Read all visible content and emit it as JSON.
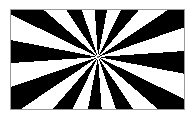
{
  "figure": {
    "title": "Starburst radial pattern",
    "kind": "radial-sunburst",
    "background_color": "#ffffff",
    "page_background_color": "#ffffff",
    "border_color": "#9a9a9a",
    "border_width_px": 1,
    "frame": {
      "left_px": 10,
      "top_px": 9,
      "width_px": 175,
      "height_px": 101
    }
  },
  "chart_data": {
    "type": "pie",
    "title": "Starburst radial pattern",
    "subtitle": "",
    "xlabel": "",
    "ylabel": "",
    "legend_position": "none",
    "grid": false,
    "center": {
      "x_px": 98,
      "y_px": 57,
      "x_fraction": 0.503,
      "y_fraction": 0.475
    },
    "sector_count": 24,
    "ray_count": 12,
    "start_angle_deg": -4,
    "colors": [
      "#000000",
      "#ffffff"
    ],
    "categories": [
      "sector-1",
      "sector-2",
      "sector-3",
      "sector-4",
      "sector-5",
      "sector-6",
      "sector-7",
      "sector-8",
      "sector-9",
      "sector-10",
      "sector-11",
      "sector-12",
      "sector-13",
      "sector-14",
      "sector-15",
      "sector-16",
      "sector-17",
      "sector-18",
      "sector-19",
      "sector-20",
      "sector-21",
      "sector-22",
      "sector-23",
      "sector-24"
    ],
    "values": [
      15,
      15,
      15,
      15,
      15,
      15,
      15,
      15,
      15,
      15,
      15,
      15,
      15,
      15,
      15,
      15,
      15,
      15,
      15,
      15,
      15,
      15,
      15,
      15
    ],
    "sector_fills": [
      "#000000",
      "#ffffff",
      "#000000",
      "#ffffff",
      "#000000",
      "#ffffff",
      "#000000",
      "#ffffff",
      "#000000",
      "#ffffff",
      "#000000",
      "#ffffff",
      "#000000",
      "#ffffff",
      "#000000",
      "#ffffff",
      "#000000",
      "#ffffff",
      "#000000",
      "#ffffff",
      "#000000",
      "#ffffff",
      "#000000",
      "#ffffff"
    ],
    "annotations": []
  }
}
